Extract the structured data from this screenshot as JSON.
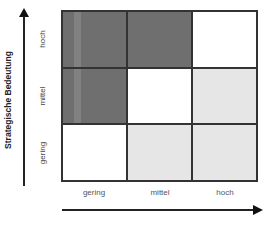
{
  "diagram": {
    "type": "3x3 portfolio matrix",
    "y_axis": {
      "title": "Strategische Bedeutung",
      "levels_bottom_to_top": [
        "gering",
        "mittel",
        "hoch"
      ]
    },
    "x_axis": {
      "title": "",
      "levels_left_to_right": [
        "gering",
        "mittel",
        "hoch"
      ]
    },
    "rows": [
      {
        "label": "hoch",
        "cells": [
          "dark",
          "dark",
          "white"
        ]
      },
      {
        "label": "mittel",
        "cells": [
          "dark",
          "white",
          "light"
        ]
      },
      {
        "label": "gering",
        "cells": [
          "white",
          "light",
          "light"
        ]
      }
    ],
    "colors": {
      "dark": "#6f6f6f",
      "light": "#e6e6e6",
      "white": "#ffffff",
      "lines": "#333333"
    }
  }
}
